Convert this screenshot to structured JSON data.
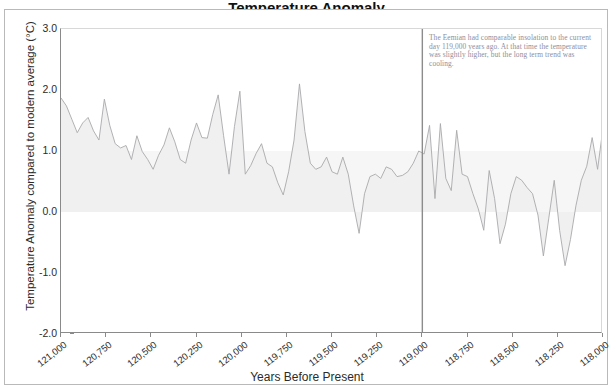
{
  "chart_data": {
    "type": "area",
    "title": "Temperature Anomaly",
    "xlabel": "Years Before Present",
    "ylabel": "Temperature Anomaly compared to modern average (°C)",
    "ylim": [
      -2.0,
      3.0
    ],
    "yticks": [
      "3.0",
      "2.0",
      "1.0",
      "0.0",
      "-1.0",
      "-2.0"
    ],
    "ytick_values": [
      3.0,
      2.0,
      1.0,
      0.0,
      -1.0,
      -2.0
    ],
    "xlim": [
      121000,
      118000
    ],
    "xticks": [
      "121,000",
      "120,750",
      "120,500",
      "120,250",
      "120,000",
      "119,750",
      "119,500",
      "119,250",
      "119,000",
      "118,750",
      "118,500",
      "118,250",
      "118,000"
    ],
    "xtick_values": [
      121000,
      120750,
      120500,
      120250,
      120000,
      119750,
      119500,
      119250,
      119000,
      118750,
      118500,
      118250,
      118000
    ],
    "grid": false,
    "legend": "none",
    "line_color": "#a9a9ad",
    "fill_color": "#f0f0f0",
    "marker_line_color": "#8c8c8c",
    "marker_x_value": 119000,
    "annotation": "The Eemian had comparable insolation to the current day 119,000 years ago.  At that time the temperature was slightly higher, but the long term trend was cooling.",
    "x": [
      121000,
      120970,
      120940,
      120910,
      120880,
      120850,
      120820,
      120790,
      120760,
      120730,
      120700,
      120670,
      120640,
      120610,
      120580,
      120550,
      120520,
      120490,
      120460,
      120430,
      120400,
      120370,
      120340,
      120310,
      120280,
      120250,
      120220,
      120190,
      120160,
      120130,
      120100,
      120070,
      120040,
      120010,
      119980,
      119950,
      119920,
      119890,
      119860,
      119830,
      119800,
      119770,
      119740,
      119710,
      119680,
      119650,
      119620,
      119590,
      119560,
      119530,
      119500,
      119470,
      119440,
      119410,
      119380,
      119350,
      119320,
      119290,
      119260,
      119230,
      119200,
      119170,
      119140,
      119110,
      119080,
      119050,
      119020,
      118990,
      118960,
      118930,
      118900,
      118870,
      118840,
      118810,
      118780,
      118750,
      118720,
      118690,
      118660,
      118630,
      118600,
      118570,
      118540,
      118510,
      118480,
      118450,
      118420,
      118390,
      118360,
      118330,
      118300,
      118270,
      118240,
      118210,
      118180,
      118150,
      118120,
      118090,
      118060,
      118030,
      118000
    ],
    "values": [
      1.87,
      1.74,
      1.52,
      1.3,
      1.46,
      1.55,
      1.33,
      1.18,
      1.85,
      1.42,
      1.12,
      1.05,
      1.09,
      0.86,
      1.25,
      0.99,
      0.86,
      0.7,
      0.93,
      1.1,
      1.38,
      1.15,
      0.86,
      0.8,
      1.18,
      1.46,
      1.22,
      1.21,
      1.6,
      1.92,
      1.25,
      0.62,
      1.4,
      1.98,
      0.62,
      0.76,
      0.96,
      1.12,
      0.8,
      0.74,
      0.48,
      0.28,
      0.66,
      1.18,
      2.1,
      1.32,
      0.8,
      0.7,
      0.74,
      0.9,
      0.66,
      0.62,
      0.9,
      0.62,
      0.1,
      -0.35,
      0.3,
      0.58,
      0.62,
      0.55,
      0.74,
      0.7,
      0.58,
      0.6,
      0.66,
      0.8,
      1.0,
      0.95,
      1.42,
      0.22,
      1.45,
      0.55,
      0.35,
      1.34,
      0.62,
      0.58,
      0.3,
      0.05,
      -0.3,
      0.68,
      0.22,
      -0.52,
      -0.2,
      0.3,
      0.58,
      0.52,
      0.4,
      0.3,
      -0.05,
      -0.72,
      -0.1,
      0.52,
      -0.3,
      -0.88,
      -0.45,
      0.1,
      0.52,
      0.75,
      1.22,
      0.7,
      1.38
    ]
  }
}
